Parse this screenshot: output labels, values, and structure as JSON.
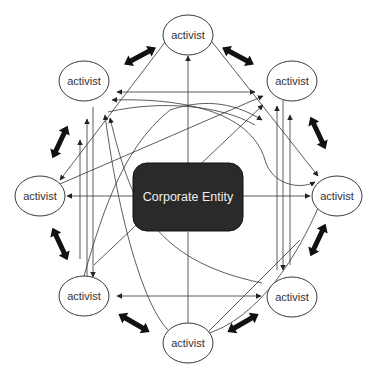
{
  "diagram": {
    "type": "network",
    "center": {
      "label": "Corporate Entity",
      "fill": "#2a2a2a",
      "text_color": "#eeeeee"
    },
    "nodes": [
      {
        "id": "top",
        "label": "activist"
      },
      {
        "id": "top-right",
        "label": "activist"
      },
      {
        "id": "right",
        "label": "activist"
      },
      {
        "id": "bottom-right",
        "label": "activist"
      },
      {
        "id": "bottom",
        "label": "activist"
      },
      {
        "id": "bottom-left",
        "label": "activist"
      },
      {
        "id": "left",
        "label": "activist"
      },
      {
        "id": "top-left",
        "label": "activist"
      }
    ],
    "ring_connectors": {
      "style": "thick-double-arrow",
      "pairs": [
        [
          "top",
          "top-right"
        ],
        [
          "top-right",
          "right"
        ],
        [
          "right",
          "bottom-right"
        ],
        [
          "bottom-right",
          "bottom"
        ],
        [
          "bottom",
          "bottom-left"
        ],
        [
          "bottom-left",
          "left"
        ],
        [
          "left",
          "top-left"
        ],
        [
          "top-left",
          "top"
        ]
      ]
    },
    "cross_connectors": {
      "style": "thin-arrows",
      "description": "many thin straight and curved arrows linking activists to each other across the Corporate Entity"
    }
  }
}
